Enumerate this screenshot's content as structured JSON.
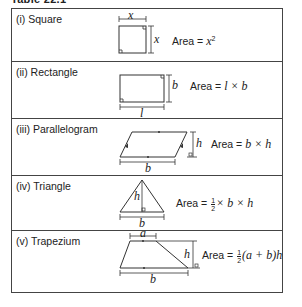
{
  "caption": "Table 22.1",
  "rows": [
    {
      "label": "(i) Square",
      "formula_prefix": "Area = ",
      "formula": "x",
      "sup": "2",
      "dims": {
        "top": "x",
        "side": "x"
      }
    },
    {
      "label": "(ii) Rectangle",
      "formula_prefix": "Area = ",
      "formula": "l × b",
      "dims": {
        "side": "b",
        "bottom": "l"
      }
    },
    {
      "label": "(iii) Parallelogram",
      "formula_prefix": "Area = ",
      "formula": "b × h",
      "dims": {
        "side": "h",
        "bottom": "b"
      }
    },
    {
      "label": "(iv) Triangle",
      "formula_prefix": "Area = ",
      "frac_num": "1",
      "frac_den": "2",
      "formula": "× b × h",
      "dims": {
        "height": "h",
        "bottom": "b"
      }
    },
    {
      "label": "(v) Trapezium",
      "formula_prefix": "Area = ",
      "frac_num": "1",
      "frac_den": "2",
      "formula": "(a + b)h",
      "dims": {
        "top": "a",
        "side": "h",
        "bottom": "b"
      }
    }
  ]
}
